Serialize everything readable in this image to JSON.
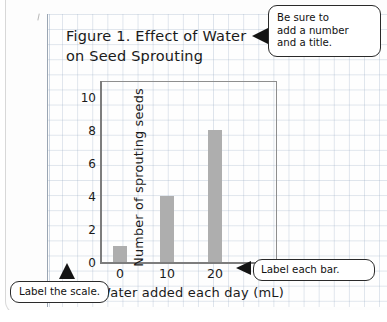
{
  "figure": {
    "title": "Figure 1. Effect of Water\non Seed Sprouting"
  },
  "chart_data": {
    "type": "bar",
    "title": "Figure 1. Effect of Water on Seed Sprouting",
    "categories": [
      "0",
      "10",
      "20"
    ],
    "values": [
      1,
      4,
      8
    ],
    "xlabel": "Water added each day (mL)",
    "ylabel": "Number of sprouting seeds",
    "ylim": [
      0,
      11
    ],
    "yticks": [
      "0",
      "2",
      "4",
      "6",
      "8",
      "10"
    ],
    "ytick_values": [
      0,
      2,
      4,
      6,
      8,
      10
    ],
    "xticks": [
      "0",
      "10",
      "20"
    ],
    "grid": true,
    "legend": "none",
    "bar_color": "#aeaeae",
    "axis_color": "#7d7d7d",
    "grid_color": "#96aac3"
  },
  "callouts": [
    {
      "id": "title-callout",
      "text": "Be sure to\nadd a number\nand a title.",
      "pointer": "left-triangle"
    },
    {
      "id": "bar-label-callout",
      "text": "Label each bar.",
      "pointer": "left-triangle"
    },
    {
      "id": "scale-label-callout",
      "text": "Label the scale.",
      "pointer": "up-triangle"
    }
  ],
  "colors": {
    "bar": "#aeaeae",
    "grid": "#96aac3",
    "ink": "#1a1a1a",
    "callout_border": "#2a2a2a",
    "paper": "#fdfdfd"
  }
}
